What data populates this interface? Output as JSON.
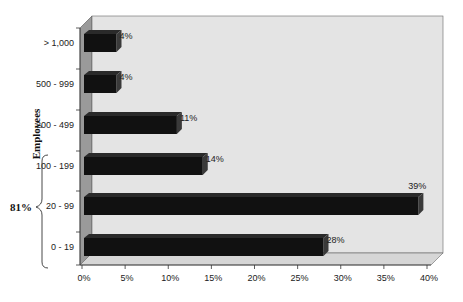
{
  "chart_data": {
    "type": "bar",
    "orientation": "horizontal",
    "style": "3d",
    "title": "",
    "xlabel": "",
    "ylabel": "Employees",
    "categories": [
      "> 1,000",
      "500 - 999",
      "200 - 499",
      "100 - 199",
      "20 - 99",
      "0 - 19"
    ],
    "values": [
      4,
      4,
      11,
      14,
      39,
      28
    ],
    "value_labels": [
      "4%",
      "4%",
      "11%",
      "14%",
      "39%",
      "28%"
    ],
    "xlim": [
      0,
      40
    ],
    "x_ticks": [
      "0%",
      "5%",
      "10%",
      "15%",
      "20%",
      "25%",
      "30%",
      "35%",
      "40%"
    ],
    "grid": false,
    "legend": null,
    "annotations": [
      {
        "type": "brace",
        "spans": [
          "100 - 199",
          "20 - 99",
          "0 - 19"
        ],
        "label": "81%"
      }
    ],
    "colors": {
      "bar": "#111111",
      "wall": "#e4e4e4",
      "side_wall": "#9a9a9a",
      "floor": "#d6d6d6"
    }
  }
}
